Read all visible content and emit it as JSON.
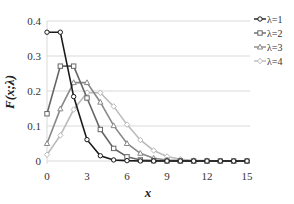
{
  "chart_data": {
    "type": "line",
    "title": "",
    "xlabel": "x",
    "ylabel": "F(x;λ)",
    "xlim": [
      0,
      15
    ],
    "ylim": [
      0,
      0.4
    ],
    "x_ticks": [
      0,
      3,
      6,
      9,
      12,
      15
    ],
    "y_ticks": [
      0,
      0.1,
      0.2,
      0.3,
      0.4
    ],
    "y_tick_labels": [
      "0",
      "0.1",
      "0.2",
      "0.3",
      "0.4"
    ],
    "grid": "horizontal",
    "legend_position": "right-top",
    "x": [
      0,
      1,
      2,
      3,
      4,
      5,
      6,
      7,
      8,
      9,
      10,
      11,
      12,
      13,
      14,
      15
    ],
    "series": [
      {
        "name": "λ=1",
        "color": "#1a1a1a",
        "marker": "circle",
        "values": [
          0.368,
          0.368,
          0.184,
          0.061,
          0.015,
          0.003,
          0.001,
          0,
          0,
          0,
          0,
          0,
          0,
          0,
          0,
          0
        ]
      },
      {
        "name": "λ=2",
        "color": "#666666",
        "marker": "square",
        "values": [
          0.135,
          0.271,
          0.271,
          0.18,
          0.09,
          0.036,
          0.012,
          0.003,
          0.001,
          0,
          0,
          0,
          0,
          0,
          0,
          0
        ]
      },
      {
        "name": "λ=3",
        "color": "#888888",
        "marker": "triangle",
        "values": [
          0.05,
          0.149,
          0.224,
          0.224,
          0.168,
          0.101,
          0.05,
          0.022,
          0.008,
          0.003,
          0.001,
          0,
          0,
          0,
          0,
          0
        ]
      },
      {
        "name": "λ=4",
        "color": "#bbbbbb",
        "marker": "diamond",
        "values": [
          0.018,
          0.073,
          0.147,
          0.195,
          0.195,
          0.156,
          0.104,
          0.06,
          0.03,
          0.013,
          0.005,
          0.002,
          0.001,
          0,
          0,
          0
        ]
      }
    ]
  }
}
